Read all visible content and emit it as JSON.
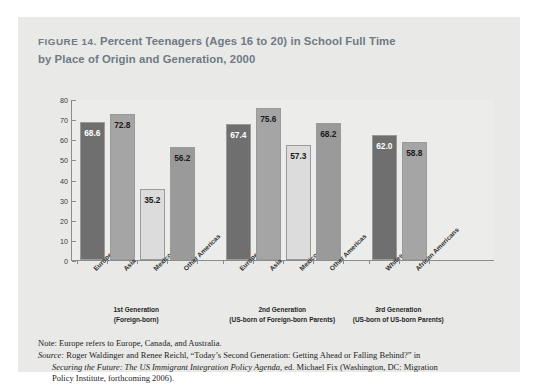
{
  "figure": {
    "number_label": "FIGURE 14.",
    "title_rest": " Percent Teenagers (Ages 16 to 20) in School Full Time",
    "title_line2": "by Place of Origin and Generation, 2000"
  },
  "notes": {
    "note_line": "Note: Europe refers to Europe, Canada, and Australia.",
    "source_label": "Source:",
    "source_part1": " Roger Waldinger and Renee Reichl, “Today’s Second Generation: Getting Ahead or Falling Behind?” in",
    "source_italic": "Securing the Future: The US Immigrant Integration Policy Agenda",
    "source_part2": ", ed. Michael Fix (Washington, DC: Migration",
    "source_part3": "Policy Institute, forthcoming 2006)."
  },
  "chart_data": {
    "type": "bar",
    "title": "FIGURE 14. Percent Teenagers (Ages 16 to 20) in School Full Time by Place of Origin and Generation, 2000",
    "xlabel": "",
    "ylabel": "",
    "ylim": [
      0,
      80
    ],
    "yticks": [
      0,
      10,
      20,
      30,
      40,
      50,
      60,
      70,
      80
    ],
    "ytick_labels": [
      "0",
      "10",
      "20",
      "30",
      "40",
      "50",
      "60",
      "70",
      "80"
    ],
    "grid": false,
    "legend": "none",
    "groups": [
      {
        "label_line1": "1st Generation",
        "label_line2": "(Foreign-born)",
        "categories": [
          "Europe",
          "Asia",
          "Mexico",
          "Other Americas"
        ],
        "values": [
          68.6,
          72.8,
          35.2,
          56.2
        ],
        "value_labels": [
          "68.6",
          "72.8",
          "35.2",
          "56.2"
        ],
        "colors": [
          "#6f6f6f",
          "#a5a5a5",
          "#dcdcdc",
          "#9a9a9a"
        ],
        "label_colors": [
          "#ffffff",
          "#1a1a1a",
          "#1a1a1a",
          "#1a1a1a"
        ]
      },
      {
        "label_line1": "2nd Generation",
        "label_line2": "(US-born of Foreign-born Parents)",
        "categories": [
          "Europe",
          "Asia",
          "Mexico",
          "Other Americas"
        ],
        "values": [
          67.4,
          75.6,
          57.3,
          68.2
        ],
        "value_labels": [
          "67.4",
          "75.6",
          "57.3",
          "68.2"
        ],
        "colors": [
          "#6f6f6f",
          "#a5a5a5",
          "#dcdcdc",
          "#9a9a9a"
        ],
        "label_colors": [
          "#ffffff",
          "#1a1a1a",
          "#1a1a1a",
          "#1a1a1a"
        ]
      },
      {
        "label_line1": "3rd Generation",
        "label_line2": "(US-born of US-born Parents)",
        "categories": [
          "Whites",
          "African Americans"
        ],
        "values": [
          62.0,
          58.8
        ],
        "value_labels": [
          "62.0",
          "58.8"
        ],
        "colors": [
          "#6f6f6f",
          "#a5a5a5"
        ],
        "label_colors": [
          "#ffffff",
          "#1a1a1a"
        ]
      }
    ]
  }
}
